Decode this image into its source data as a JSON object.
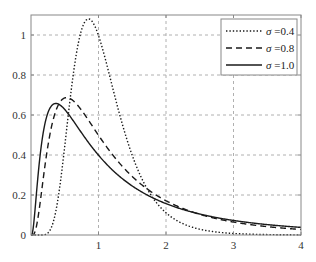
{
  "chart_data": {
    "type": "line",
    "title": "",
    "xlabel": "",
    "ylabel": "",
    "xlim": [
      0,
      4
    ],
    "ylim": [
      0,
      1.1
    ],
    "x_ticks": [
      1,
      2,
      3,
      4
    ],
    "x_tick_labels": [
      "1",
      "2",
      "3",
      "4"
    ],
    "y_ticks": [
      0,
      0.2,
      0.4,
      0.6,
      0.8,
      1
    ],
    "y_tick_labels": [
      "0",
      "0.2",
      "0.4",
      "0.6",
      "0.8",
      "1"
    ],
    "grid": true,
    "legend_position": "upper right",
    "series": [
      {
        "name": "σ =0.4",
        "sigma": 0.4,
        "style": "dotted",
        "x": [
          0.25,
          0.5,
          0.75,
          0.85,
          1.0,
          1.25,
          1.5,
          2.0,
          2.5,
          3.0,
          4.0
        ],
        "values": [
          0.01,
          0.444,
          1.027,
          1.08,
          0.997,
          0.683,
          0.398,
          0.111,
          0.029,
          0.008,
          0.001
        ]
      },
      {
        "name": "σ =0.8",
        "sigma": 0.8,
        "style": "dashed",
        "x": [
          0.25,
          0.5,
          0.53,
          0.75,
          1.0,
          1.5,
          2.0,
          3.0,
          4.0
        ],
        "values": [
          0.444,
          0.685,
          0.687,
          0.623,
          0.499,
          0.292,
          0.171,
          0.065,
          0.028
        ]
      },
      {
        "name": "σ =1.0",
        "sigma": 1.0,
        "style": "solid",
        "x": [
          0.25,
          0.37,
          0.5,
          1.0,
          1.5,
          2.0,
          3.0,
          4.0
        ],
        "values": [
          0.61,
          0.657,
          0.627,
          0.399,
          0.245,
          0.157,
          0.073,
          0.038
        ]
      }
    ]
  },
  "legend": {
    "items": [
      {
        "symbol": "σ",
        "text": " =0.4"
      },
      {
        "symbol": "σ",
        "text": " =0.8"
      },
      {
        "symbol": "σ",
        "text": " =1.0"
      }
    ]
  },
  "colors": {
    "line": "#1a1a1a",
    "grid": "#b0b0b0",
    "frame": "#888888",
    "background": "#ffffff"
  }
}
